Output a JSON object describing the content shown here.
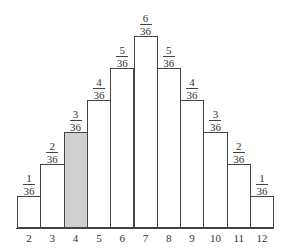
{
  "chart_data": {
    "type": "bar",
    "title": "",
    "xlabel": "",
    "ylabel": "",
    "categories": [
      "2",
      "3",
      "4",
      "5",
      "6",
      "7",
      "8",
      "9",
      "10",
      "11",
      "12"
    ],
    "values": [
      1,
      2,
      3,
      4,
      5,
      6,
      5,
      4,
      3,
      2,
      1
    ],
    "labels": [
      {
        "num": "1",
        "den": "36"
      },
      {
        "num": "2",
        "den": "36"
      },
      {
        "num": "3",
        "den": "36"
      },
      {
        "num": "4",
        "den": "36"
      },
      {
        "num": "5",
        "den": "36"
      },
      {
        "num": "6",
        "den": "36"
      },
      {
        "num": "5",
        "den": "36"
      },
      {
        "num": "4",
        "den": "36"
      },
      {
        "num": "3",
        "den": "36"
      },
      {
        "num": "2",
        "den": "36"
      },
      {
        "num": "1",
        "den": "36"
      }
    ],
    "denominator": 36,
    "highlighted_category": "4",
    "highlight_color": "#d0d0d0",
    "bar_color": "#ffffff",
    "grid": false,
    "legend": null
  }
}
